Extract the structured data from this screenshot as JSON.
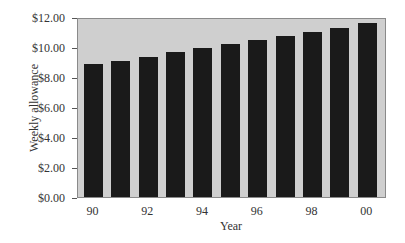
{
  "chart_data": {
    "type": "bar",
    "title": "",
    "xlabel": "Year",
    "ylabel": "Weekly allowance",
    "categories": [
      "90",
      "91",
      "92",
      "93",
      "94",
      "95",
      "96",
      "97",
      "98",
      "99",
      "00"
    ],
    "values": [
      8.95,
      9.15,
      9.45,
      9.75,
      10.05,
      10.3,
      10.6,
      10.85,
      11.1,
      11.4,
      11.75
    ],
    "ylim": [
      0,
      12
    ],
    "yticks": [
      "$0.00",
      "$2.00",
      "$4.00",
      "$6.00",
      "$8.00",
      "$10.00",
      "$12.00"
    ],
    "xticks": [
      "90",
      "92",
      "94",
      "96",
      "98",
      "00"
    ],
    "grid": false,
    "legend": null,
    "colors": {
      "bar": "#1a1a1a",
      "plot_background": "#cfcfcf"
    }
  }
}
